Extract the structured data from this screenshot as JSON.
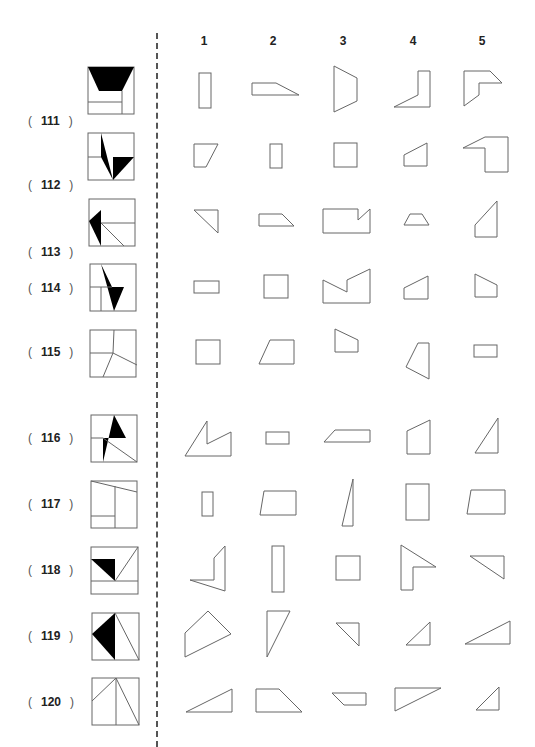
{
  "columns": [
    "1",
    "2",
    "3",
    "4",
    "5"
  ],
  "rows": [
    {
      "label": "111",
      "open": "(",
      "close": ")"
    },
    {
      "label": "112",
      "open": "(",
      "close": ")"
    },
    {
      "label": "113",
      "open": "(",
      "close": ")"
    },
    {
      "label": "114",
      "open": "(",
      "close": ")"
    },
    {
      "label": "115",
      "open": "(",
      "close": ")"
    },
    {
      "label": "116",
      "open": "(",
      "close": ")"
    },
    {
      "label": "117",
      "open": "(",
      "close": ")"
    },
    {
      "label": "118",
      "open": "(",
      "close": ")"
    },
    {
      "label": "119",
      "open": "(",
      "close": ")"
    },
    {
      "label": "120",
      "open": "(",
      "close": ")"
    }
  ],
  "colors": {
    "line": "#666666",
    "text": "#222222",
    "divider": "#555555"
  }
}
